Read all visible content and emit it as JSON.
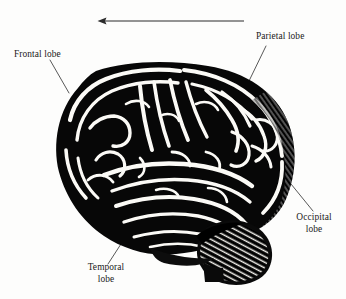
{
  "figure": {
    "background_color": "#fdfdfc",
    "ink_color": "#000000",
    "text_color": "#1a1a1a"
  },
  "direction_arrow": {
    "name": "anterior-direction-arrow",
    "points": "left",
    "x_start": 244,
    "x_end": 98,
    "y": 21,
    "color": "#2b2b2b"
  },
  "labels": {
    "frontal": {
      "text": "Frontal lobe",
      "x": 14,
      "y": 49,
      "leader": {
        "x1": 50,
        "y1": 60,
        "x2": 69,
        "y2": 93
      }
    },
    "parietal": {
      "text": "Parietal lobe",
      "x": 256,
      "y": 31,
      "leader": {
        "x1": 266,
        "y1": 46,
        "x2": 249,
        "y2": 81
      }
    },
    "occipital": {
      "text": "Occipital\nlobe",
      "x": 288,
      "y": 212,
      "leader": {
        "x1": 291,
        "y1": 184,
        "x2": 313,
        "y2": 211
      }
    },
    "temporal": {
      "text": "Temporal\nlobe",
      "x": 74,
      "y": 262,
      "leader": {
        "x1": 132,
        "y1": 227,
        "x2": 108,
        "y2": 264
      }
    }
  },
  "brain_illustration": {
    "name": "brain-lateral-engraving",
    "style": "woodcut-engraving",
    "bounds": {
      "x": 55,
      "y": 62,
      "width": 240,
      "height": 213
    },
    "regions": [
      "cerebrum",
      "cerebellum",
      "brainstem"
    ]
  }
}
